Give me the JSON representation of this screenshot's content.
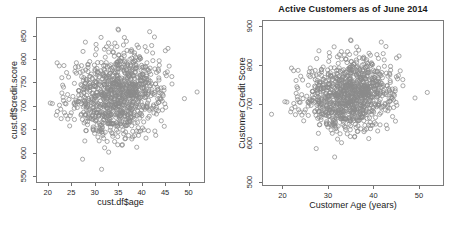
{
  "figure": {
    "background_color": "#ffffff",
    "point_color": "#8a8a8a",
    "axis_color": "#7a7a7a",
    "text_color": "#1a1a1a",
    "marker": "open-circle"
  },
  "chart_data": [
    {
      "type": "scatter",
      "panel": "left",
      "title": "",
      "xlabel": "cust.df$age",
      "ylabel": "cust.df$credit.score",
      "xlim": [
        17.5,
        53.5
      ],
      "ylim": [
        535,
        890
      ],
      "xticks": [
        20,
        25,
        30,
        35,
        40,
        45,
        50
      ],
      "yticks": [
        550,
        600,
        650,
        700,
        750,
        800,
        850
      ],
      "grid": false,
      "legend": "none",
      "n_points": 1000,
      "marker": "open-circle",
      "marker_size": 2.1,
      "point_color": "#8a8a8a",
      "distribution": {
        "x_mean": 35.0,
        "x_sd": 5.0,
        "y_mean": 725.0,
        "y_sd": 48.0,
        "correlation": 0.17
      }
    },
    {
      "type": "scatter",
      "panel": "right",
      "title": "Active Customers as of June 2014",
      "xlabel": "Customer Age (years)",
      "ylabel": "Customer Credit Score",
      "xlim": [
        15.5,
        55.5
      ],
      "ylim": [
        490,
        915
      ],
      "xticks": [
        20,
        30,
        40,
        50
      ],
      "yticks": [
        500,
        600,
        700,
        800,
        900
      ],
      "grid": false,
      "legend": "none",
      "n_points": 1000,
      "marker": "open-circle",
      "marker_size": 2.1,
      "point_color": "#8a8a8a",
      "distribution": {
        "x_mean": 35.0,
        "x_sd": 5.0,
        "y_mean": 725.0,
        "y_sd": 48.0,
        "correlation": 0.17
      }
    }
  ]
}
